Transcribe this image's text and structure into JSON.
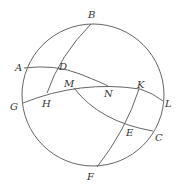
{
  "diagram": {
    "type": "spherical-geometry",
    "circle": {
      "cx": 93,
      "cy": 95,
      "r": 71
    },
    "points": {
      "A": {
        "label": "A",
        "x": 24,
        "y": 68,
        "lx": 15,
        "ly": 71
      },
      "B": {
        "label": "B",
        "x": 91,
        "y": 24,
        "lx": 88,
        "ly": 18
      },
      "C": {
        "label": "C",
        "x": 153,
        "y": 131,
        "lx": 155,
        "ly": 141
      },
      "D": {
        "label": "D",
        "x": 57,
        "y": 69,
        "lx": 59,
        "ly": 70
      },
      "E": {
        "label": "E",
        "x": 128,
        "y": 125,
        "lx": 126,
        "ly": 136
      },
      "F": {
        "label": "F",
        "x": 97,
        "y": 167,
        "lx": 87,
        "ly": 180
      },
      "G": {
        "label": "G",
        "x": 23,
        "y": 103,
        "lx": 10,
        "ly": 110
      },
      "H": {
        "label": "H",
        "x": 47,
        "y": 93,
        "lx": 42,
        "ly": 107
      },
      "K": {
        "label": "K",
        "x": 139,
        "y": 89,
        "lx": 137,
        "ly": 88
      },
      "L": {
        "label": "L",
        "x": 163,
        "y": 101,
        "lx": 165,
        "ly": 107
      },
      "M": {
        "label": "M",
        "x": 74,
        "y": 88,
        "lx": 64,
        "ly": 87
      },
      "N": {
        "label": "N",
        "x": 108,
        "y": 86,
        "lx": 104,
        "ly": 97
      }
    },
    "arcs": [
      {
        "name": "arc-AN",
        "from": "A",
        "to": "N"
      },
      {
        "name": "arc-GL",
        "from": "G",
        "to": "L"
      },
      {
        "name": "arc-BH",
        "from": "B",
        "to": "H"
      },
      {
        "name": "arc-MC",
        "from": "M",
        "to": "C"
      },
      {
        "name": "arc-KF",
        "from": "K",
        "to": "F"
      }
    ]
  }
}
